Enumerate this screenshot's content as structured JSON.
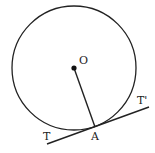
{
  "diagram": {
    "labels": {
      "center": "O",
      "point_of_contact": "A",
      "tangent_left": "T",
      "tangent_right": "T'"
    },
    "circle": {
      "cx": 74,
      "cy": 68,
      "r": 62
    },
    "stroke_color": "#222222"
  }
}
